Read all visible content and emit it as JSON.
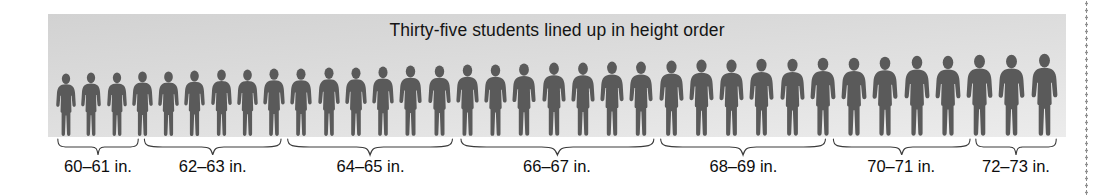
{
  "figure": {
    "title": "Thirty-five students lined up in height order",
    "total_students": 35,
    "panel_color": "#d9d9d9",
    "person_color": "#5a5a5a",
    "text_color": "#0d0d0d",
    "brace_color": "#3c3c3c",
    "dotted_rule_color": "#8e8e8e",
    "icon_names": {
      "person": "person-silhouette-icon",
      "brace": "curly-brace-icon",
      "rule": "dotted-vertical-rule"
    }
  },
  "chart_data": {
    "type": "bar",
    "title": "Thirty-five students lined up in height order",
    "xlabel": "Height",
    "ylabel": "Number of students",
    "unit": "in.",
    "categories": [
      "60–61 in.",
      "62–63 in.",
      "64–65 in.",
      "66–67 in.",
      "68–69 in.",
      "70–71 in.",
      "72–73 in."
    ],
    "values": [
      3,
      5,
      6,
      7,
      6,
      5,
      3
    ],
    "total": 35,
    "grid": false,
    "legend": false
  },
  "groups": [
    {
      "label": "60–61 in.",
      "count": 3
    },
    {
      "label": "62–63 in.",
      "count": 5
    },
    {
      "label": "64–65 in.",
      "count": 6
    },
    {
      "label": "66–67 in.",
      "count": 7
    },
    {
      "label": "68–69 in.",
      "count": 6
    },
    {
      "label": "70–71 in.",
      "count": 5
    },
    {
      "label": "72–73 in.",
      "count": 3
    }
  ]
}
